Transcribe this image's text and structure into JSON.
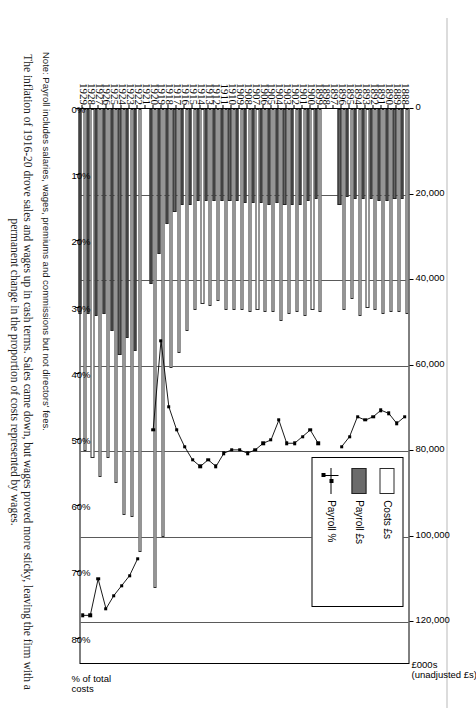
{
  "figure": {
    "notes": {
      "note1": "Note: Payroll includes salaries, wages, premiums and commissions but not directors' fees.",
      "note2": "The inflation of 1916-20 drove sales and wages up in cash terms. Sales came down, but wages proved more sticky, leaving the firm with a permanent change in the proportion of costs represented by wages."
    }
  },
  "legend": {
    "position": "inside-top-right",
    "items": [
      {
        "key": "costs",
        "label": "Costs £s",
        "swatch": "white-bar"
      },
      {
        "key": "payroll",
        "label": "Payroll £s",
        "swatch": "grey-bar"
      },
      {
        "key": "percent",
        "label": "Payroll %",
        "swatch": "line-marker"
      }
    ]
  },
  "chart_data": {
    "type": "bar",
    "title": "",
    "subtitle": "",
    "orientation": "horizontal-bars-with-overlaid-line",
    "grid": true,
    "xlabel_primary": "£000s (unadjusted £s)",
    "xlabel_secondary": "% of total costs",
    "ylabel": "",
    "categories": [
      "1888",
      "1889",
      "1890",
      "1891",
      "1892",
      "1893",
      "1894",
      "1895",
      "1896",
      "1897",
      "1898",
      "1899",
      "1900",
      "1901",
      "1902",
      "1903",
      "1904",
      "1905",
      "1906",
      "1907",
      "1908",
      "1909",
      "1910",
      "1911",
      "1912",
      "1913",
      "1914",
      "1915",
      "1916",
      "1917",
      "1918",
      "1919",
      "1920",
      "1921",
      "1922",
      "1923",
      "1924",
      "1925",
      "1926",
      "1927",
      "1928",
      "1929"
    ],
    "primary_axis": {
      "name": "£000s (unadjusted £s)",
      "ticks": [
        0,
        20000,
        40000,
        60000,
        80000,
        100000,
        120000
      ],
      "ticklabels": [
        "0",
        "20,000",
        "40,000",
        "60,000",
        "80,000",
        "100,000",
        "120,000"
      ],
      "lim": [
        0,
        130000
      ]
    },
    "secondary_axis": {
      "name": "% of total costs",
      "ticks": [
        0,
        10,
        20,
        30,
        40,
        50,
        60,
        70,
        80
      ],
      "ticklabels": [
        "0%",
        "10%",
        "20%",
        "30%",
        "40%",
        "50%",
        "60%",
        "70%",
        "80%"
      ],
      "lim": [
        0,
        84
      ]
    },
    "series": [
      {
        "name": "Costs £s",
        "axis": "primary",
        "type": "bar",
        "values": [
          48000,
          47500,
          47500,
          48000,
          47000,
          46500,
          48500,
          44500,
          47000,
          null,
          null,
          47500,
          47000,
          48500,
          47500,
          48000,
          49500,
          47500,
          47500,
          47000,
          47500,
          47000,
          47000,
          47000,
          45000,
          46000,
          45500,
          47000,
          52000,
          57000,
          60500,
          100000,
          112000,
          null,
          103500,
          95500,
          95000,
          87500,
          81500,
          86000,
          81500,
          80000
        ]
      },
      {
        "name": "Payroll £s",
        "axis": "primary",
        "type": "bar",
        "values": [
          21000,
          21000,
          21500,
          21500,
          21000,
          21000,
          21000,
          20500,
          22500,
          null,
          null,
          21000,
          21500,
          22500,
          22500,
          22500,
          22000,
          22500,
          22000,
          22000,
          22000,
          21500,
          21500,
          21500,
          21500,
          21500,
          21500,
          22500,
          22500,
          24000,
          27000,
          34000,
          41000,
          null,
          56500,
          53500,
          57500,
          52000,
          48000,
          48500,
          48000,
          48000
        ]
      },
      {
        "name": "Payroll %",
        "axis": "secondary",
        "type": "line",
        "values": [
          46.5,
          47.5,
          46.0,
          45.5,
          46.5,
          47.0,
          46.5,
          49.5,
          51.0,
          null,
          null,
          50.5,
          48.5,
          49.5,
          50.5,
          50.5,
          47.0,
          50.0,
          50.5,
          51.5,
          52.0,
          51.5,
          51.5,
          52.0,
          54.0,
          53.0,
          54.0,
          53.0,
          51.0,
          48.5,
          45.0,
          35.0,
          48.5,
          null,
          68.0,
          70.5,
          72.0,
          73.5,
          75.5,
          71.0,
          76.5,
          76.5
        ]
      }
    ]
  }
}
